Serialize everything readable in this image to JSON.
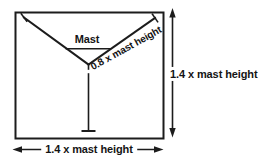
{
  "diagram": {
    "labels": {
      "mast": "Mast",
      "guy_length": "0.8 x mast height",
      "height_dimension": "1.4 x mast height",
      "width_dimension": "1.4 x mast height"
    },
    "colors": {
      "line": "#1c1c1c",
      "text": "#141414",
      "background": "#ffffff"
    }
  }
}
